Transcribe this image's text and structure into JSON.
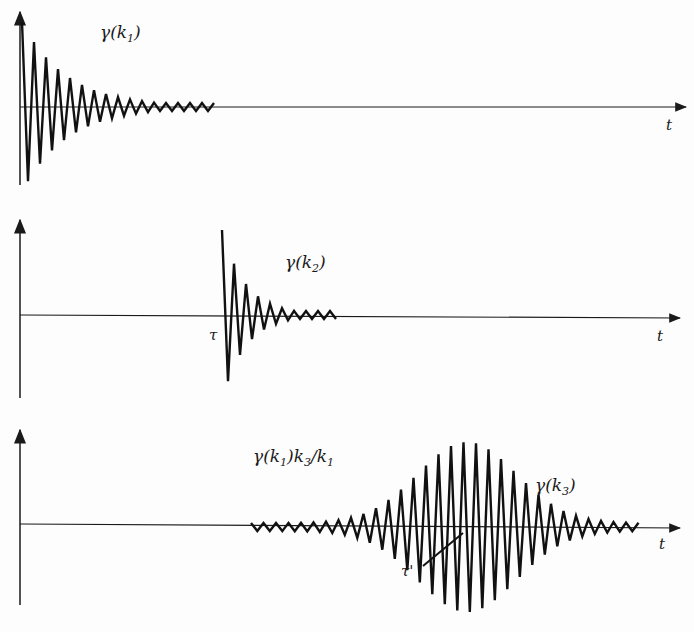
{
  "panels": [
    {
      "id": "panel-1",
      "axis_y": 50,
      "axis_x_start": 18,
      "axis_x_end": 686,
      "vaxis_top": 12,
      "vaxis_bottom": 185,
      "label": "γ(k₁)",
      "label_main": "γ(k",
      "label_sub": "1",
      "label_end": ")",
      "label_x": 100,
      "label_y": 25,
      "t_label": "t",
      "t_x": 668,
      "t_y": 118,
      "wave": {
        "start_x": 22,
        "end_x": 216,
        "period": 12,
        "amp_start": 85,
        "decay": 0.016,
        "type": "decay",
        "baseline": 107
      }
    },
    {
      "id": "panel-2",
      "label_main": "γ(k",
      "label_sub": "2",
      "label_end": ")",
      "label_x": 285,
      "label_y": 255,
      "tau_label": "τ",
      "tau_x": 210,
      "tau_y": 330,
      "t_label": "t",
      "t_x": 658,
      "t_y": 330,
      "wave": {
        "start_x": 222,
        "end_x": 338,
        "period": 12,
        "amp_start": 85,
        "decay": 0.03,
        "type": "decay",
        "baseline": 315
      }
    },
    {
      "id": "panel-3",
      "label_left_main": "γ(k",
      "label_left_sub": "1",
      "label_left_mid": ")k",
      "label_left_sub2": "3",
      "label_left_mid2": "/k",
      "label_left_sub3": "1",
      "label_main": "γ(k",
      "label_sub": "3",
      "label_end": ")",
      "label_x": 535,
      "label_y": 478,
      "label_left_x": 253,
      "label_left_y": 450,
      "tau_label": "τ'",
      "tau_x": 402,
      "tau_y": 565,
      "t_label": "t",
      "t_x": 660,
      "t_y": 538,
      "wave": {
        "start_x": 251,
        "end_x": 640,
        "period": 12.5,
        "center_x": 467,
        "amp_peak": 85,
        "amp_floor": 4,
        "baseline": 527,
        "type": "packet"
      }
    }
  ]
}
